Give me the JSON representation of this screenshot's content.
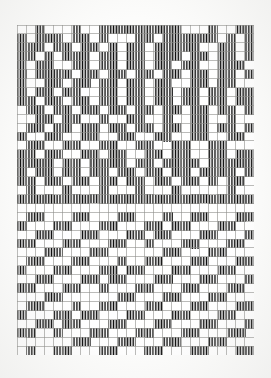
{
  "document": {
    "kind": "scanned-weaving-draft",
    "title": "Weaving draft pattern grid",
    "page_background": "#fdfdfc",
    "ink_color": "#111111",
    "grid_line_color": "#8d8d8a",
    "cell_fill_color": "#0d0d0d",
    "cell_empty_color": "#ffffff"
  },
  "grid": {
    "columns": 26,
    "rows": 37,
    "origin_x": 17,
    "origin_y": 25,
    "width": 237,
    "height": 330,
    "cell_width": 9.115,
    "cell_height": 8.919,
    "line_width": 0.6,
    "fill_style": "vertical-hatch",
    "hatch_line_count_per_cell": 6
  },
  "chart_data": {
    "type": "heatmap",
    "xlabel": "",
    "ylabel": "",
    "legend": [],
    "categories_x": [
      1,
      2,
      3,
      4,
      5,
      6,
      7,
      8,
      9,
      10,
      11,
      12,
      13,
      14,
      15,
      16,
      17,
      18,
      19,
      20,
      21,
      22,
      23,
      24,
      25,
      26
    ],
    "categories_y": [
      1,
      2,
      3,
      4,
      5,
      6,
      7,
      8,
      9,
      10,
      11,
      12,
      13,
      14,
      15,
      16,
      17,
      18,
      19,
      20,
      21,
      22,
      23,
      24,
      25,
      26,
      27,
      28,
      29,
      30,
      31,
      32,
      33,
      34,
      35,
      36,
      37
    ],
    "value_labels": {
      "0": "empty (white)",
      "1": "filled (black hatch)"
    },
    "rows": [
      "00100010011111111100010011111010010010",
      "11011101101000110111111010111011011011",
      "11111011011010110111110011011011011111",
      "11011010111011011011101101101101111011",
      "11011011001101101101101100111011011011",
      "01101101111011011011011011011011011010",
      "00110010011011011011011001101100110110",
      "11011011011011001101101101101101101101",
      "10110110110110110110110110110110110110",
      "01101101101101101101101101101101101101",
      "00100110010011011001001100100110010011",
      "11011011011011011011011011011011011011",
      "10011001100110011001100110011001100110",
      "00110011001100110011001100110011001100",
      "11011001101100110110011011001101100110",
      "11101101111011011110110111101101111011",
      "11011011011011011011011011011011011011",
      "10110110110110110110110110110110110110",
      "00010001000100010001000100010001000100",
      "11111111111111111111111111111111111111",
      "00000000000000000000000000000000000000",
      "00110001100011000110001100011000110001",
      "01100011000110001100011000110001100011",
      "11000110001100011000110001100011000110",
      "10001100011000110001100011000110001100",
      "00011000110001100011000110001100011000",
      "00110001100011000110001100011000110001",
      "01100011000110001100011000110001100011",
      "11000110001100011000110001100011000110",
      "10001100011000110001100011000110001100",
      "00011000110001100011000110001100011000",
      "00110001100011000110001100011000110001",
      "01100011000110001100011000110001100011",
      "11000110001100011000110001100011000110",
      "10001100011000110001100011000110001100",
      "00011000110001100011000110001100011000",
      "00110001100011000110001100011000110001"
    ],
    "pattern": [
      "00100110111110100100111110100100111110",
      "11011011010001101111110101110110110110",
      "11110110110101101111100110110110111111",
      "11010101110110110111011011011011110110",
      "11011011001101101101101100111011011011",
      "01101101111011011011011011011011011010",
      "00110010011011011011011001101100110110",
      "11011011011011001101101101101101101101",
      "10110110110110110110110110110110110110",
      "01101101101101101101101101101101101101",
      "00100110010011011001001100100110010011",
      "11011011011011011011011011011011011011",
      "10011001100110011001100110011001100110",
      "00110011001100110011001100110011001100",
      "11011001101100110110011011001101100110",
      "11101101111011011110110111101101111011",
      "11011011011011011011011011011011011011",
      "10110110110110110110110110110110110110",
      "00010001000100010001000100010001000100",
      "11111111111111111111111111111111111111",
      "00000000000000000000000000000000000000",
      "00110001100011000110001100011000110001"
    ]
  }
}
